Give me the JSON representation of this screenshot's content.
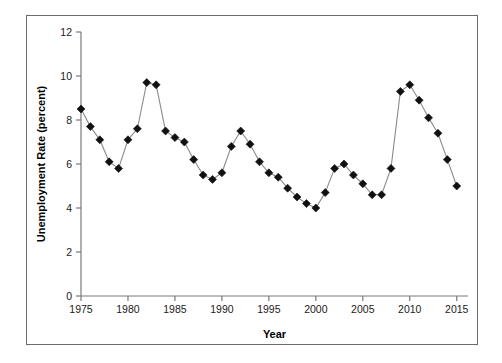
{
  "chart_data": {
    "type": "line",
    "title": "",
    "xlabel": "Year",
    "ylabel": "Unemployment Rate (percent)",
    "xlim": [
      1975,
      2016.2
    ],
    "ylim": [
      0,
      12
    ],
    "xticks": [
      1975,
      1980,
      1985,
      1990,
      1995,
      2000,
      2005,
      2010,
      2015
    ],
    "xtick_labels": [
      "1975",
      "1980",
      "1985",
      "1990",
      "1995",
      "2000",
      "2005",
      "2010",
      "2015"
    ],
    "yticks": [
      0,
      2,
      4,
      6,
      8,
      10,
      12
    ],
    "ytick_labels": [
      "0",
      "2",
      "4",
      "6",
      "8",
      "10",
      "12"
    ],
    "grid": false,
    "legend": false,
    "marker": "diamond",
    "marker_color": "#111111",
    "line_color": "#8a8a8a",
    "x": [
      1975,
      1976,
      1977,
      1978,
      1979,
      1980,
      1981,
      1982,
      1983,
      1984,
      1985,
      1986,
      1987,
      1988,
      1989,
      1990,
      1991,
      1992,
      1993,
      1994,
      1995,
      1996,
      1997,
      1998,
      1999,
      2000,
      2001,
      2002,
      2003,
      2004,
      2005,
      2006,
      2007,
      2008,
      2009,
      2010,
      2011,
      2012,
      2013,
      2014,
      2015
    ],
    "values": [
      8.5,
      7.7,
      7.1,
      6.1,
      5.8,
      7.1,
      7.6,
      9.7,
      9.6,
      7.5,
      7.2,
      7.0,
      6.2,
      5.5,
      5.3,
      5.6,
      6.8,
      7.5,
      6.9,
      6.1,
      5.6,
      5.4,
      4.9,
      4.5,
      4.2,
      4.0,
      4.7,
      5.8,
      6.0,
      5.5,
      5.1,
      4.6,
      4.6,
      5.8,
      9.3,
      9.6,
      8.9,
      8.1,
      7.4,
      6.2,
      5.0
    ],
    "series_name": "Unemployment Rate"
  },
  "figure": {
    "frame_color": "#6b6b6b",
    "background": "#ffffff"
  }
}
